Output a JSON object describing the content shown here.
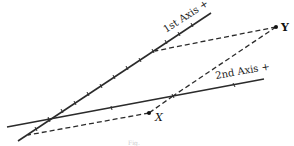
{
  "diagram": {
    "axes": [
      {
        "id": "axis1",
        "label": "1st Axis +",
        "start": [
          18,
          141
        ],
        "end": [
          211,
          13
        ]
      },
      {
        "id": "axis2",
        "label": "2nd Axis +",
        "start": [
          7,
          127
        ],
        "end": [
          264,
          79
        ]
      }
    ],
    "points": [
      {
        "id": "Y",
        "label": "Y",
        "x": 276,
        "y": 27
      },
      {
        "id": "X",
        "label": "X",
        "x": 149,
        "y": 113
      }
    ],
    "projections": [
      {
        "from": "Y",
        "to_axis": "axis1",
        "to": [
          155,
          51
        ]
      },
      {
        "from": "Y",
        "to_axis": "axis2",
        "to": [
          173,
          96
        ]
      },
      {
        "from": "X",
        "to_axis": "axis1",
        "to": [
          28,
          135
        ]
      }
    ],
    "caption": "Fig."
  }
}
